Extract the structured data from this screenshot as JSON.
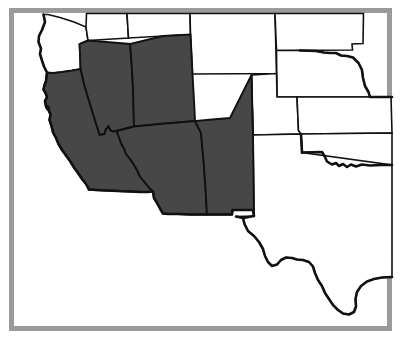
{
  "figure": {
    "width": 409,
    "height": 348
  },
  "colors": {
    "highlight_fill": "#474747",
    "unhighlighted_fill": "#ffffff",
    "state_border": "#111111",
    "frame_border": "#9b9b9b",
    "background": "#ffffff"
  },
  "legend": {
    "highlighted_meaning": "Highlighted states",
    "unhighlighted_meaning": "Other states"
  },
  "map_data": {
    "type": "choropleth",
    "region": "Western United States",
    "highlighted_count": 5,
    "states": [
      {
        "code": "CA",
        "name": "California",
        "highlighted": true,
        "label_x": 72,
        "label_y": 150
      },
      {
        "code": "NV",
        "name": "Nevada",
        "highlighted": true,
        "label_x": 112,
        "label_y": 95
      },
      {
        "code": "UT",
        "name": "Utah",
        "highlighted": true,
        "label_x": 172,
        "label_y": 88
      },
      {
        "code": "AZ",
        "name": "Arizona",
        "highlighted": true,
        "label_x": 152,
        "label_y": 170
      },
      {
        "code": "NM",
        "name": "New Mexico",
        "highlighted": true,
        "label_x": 228,
        "label_y": 172
      },
      {
        "code": "OR",
        "name": "Oregon",
        "highlighted": false,
        "label_x": 62,
        "label_y": 40
      },
      {
        "code": "ID",
        "name": "Idaho",
        "highlighted": false,
        "label_x": 130,
        "label_y": 26
      },
      {
        "code": "WY",
        "name": "Wyoming",
        "highlighted": false,
        "label_x": 212,
        "label_y": 34
      },
      {
        "code": "CO",
        "name": "Colorado",
        "highlighted": false,
        "label_x": 268,
        "label_y": 100
      },
      {
        "code": "KS",
        "name": "Kansas",
        "highlighted": false,
        "label_x": 330,
        "label_y": 112
      },
      {
        "code": "OK",
        "name": "Oklahoma",
        "highlighted": false,
        "label_x": 335,
        "label_y": 155
      },
      {
        "code": "TX",
        "name": "Texas",
        "highlighted": false,
        "label_x": 300,
        "label_y": 250
      },
      {
        "code": "NE",
        "name": "Nebraska",
        "highlighted": false,
        "label_x": 340,
        "label_y": 60
      },
      {
        "code": "SD",
        "name": "South Dakota",
        "highlighted": false,
        "label_x": 370,
        "label_y": 22
      }
    ],
    "highlighted_states": [
      "California",
      "Nevada",
      "Utah",
      "Arizona",
      "New Mexico"
    ]
  }
}
